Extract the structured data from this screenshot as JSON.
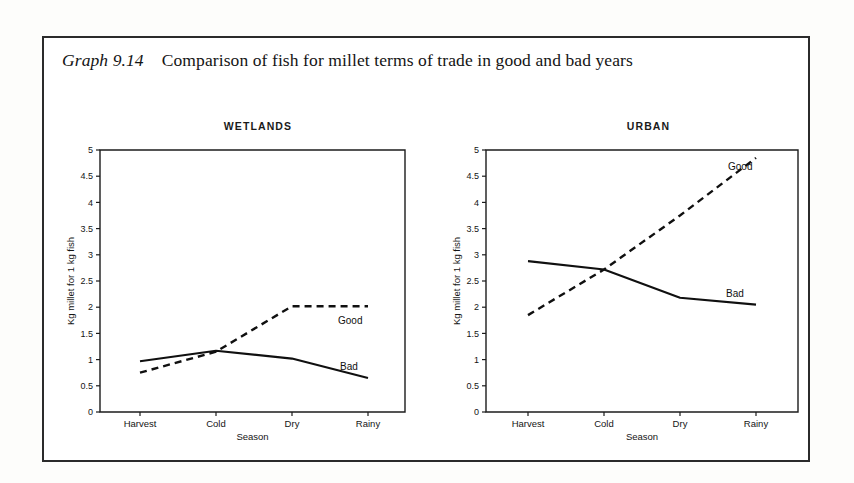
{
  "figure": {
    "caption_label": "Graph 9.14",
    "caption_text": "Comparison of fish for millet terms of trade in good and bad years"
  },
  "chart_data": [
    {
      "type": "line",
      "title": "WETLANDS",
      "xlabel": "Season",
      "ylabel": "Kg millet for 1 kg fish",
      "categories": [
        "Harvest",
        "Cold",
        "Dry",
        "Rainy"
      ],
      "ylim": [
        0,
        5
      ],
      "yticks": [
        "0",
        "0.5",
        "1",
        "1.5",
        "2",
        "2.5",
        "3",
        "3.5",
        "4",
        "4.5",
        "5"
      ],
      "ytick_values": [
        0,
        0.5,
        1,
        1.5,
        2,
        2.5,
        3,
        3.5,
        4,
        4.5,
        5
      ],
      "grid": false,
      "legend_position": "inline-right",
      "series": [
        {
          "name": "Good",
          "style": "dashed",
          "values": [
            0.75,
            1.15,
            2.02,
            2.02
          ]
        },
        {
          "name": "Bad",
          "style": "solid",
          "values": [
            0.97,
            1.17,
            1.02,
            0.65
          ]
        }
      ]
    },
    {
      "type": "line",
      "title": "URBAN",
      "xlabel": "Season",
      "ylabel": "Kg millet for 1 kg fish",
      "categories": [
        "Harvest",
        "Cold",
        "Dry",
        "Rainy"
      ],
      "ylim": [
        0,
        5
      ],
      "yticks": [
        "0",
        "0.5",
        "1",
        "1.5",
        "2",
        "2.5",
        "3",
        "3.5",
        "4",
        "4.5",
        "5"
      ],
      "ytick_values": [
        0,
        0.5,
        1,
        1.5,
        2,
        2.5,
        3,
        3.5,
        4,
        4.5,
        5
      ],
      "grid": false,
      "legend_position": "inline-right",
      "series": [
        {
          "name": "Good",
          "style": "dashed",
          "values": [
            1.85,
            2.72,
            3.75,
            4.85
          ]
        },
        {
          "name": "Bad",
          "style": "solid",
          "values": [
            2.88,
            2.72,
            2.18,
            2.05
          ]
        }
      ]
    }
  ]
}
